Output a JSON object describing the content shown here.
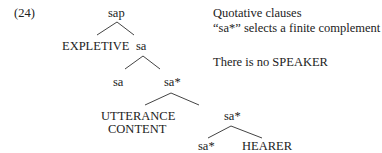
{
  "example": {
    "number": "(24)"
  },
  "tree": {
    "root": "sap",
    "level1": {
      "left": "EXPLETIVE",
      "right": "sa"
    },
    "level2": {
      "left": "sa",
      "right": "sa*"
    },
    "level3": {
      "left_line1": "UTTERANCE",
      "left_line2": "CONTENT",
      "right": "sa*"
    },
    "level4": {
      "left": "sa*",
      "right": "HEARER"
    }
  },
  "notes": {
    "title": "Quotative clauses",
    "selection": "“sa*” selects a finite complement",
    "speaker": "There is no SPEAKER"
  }
}
